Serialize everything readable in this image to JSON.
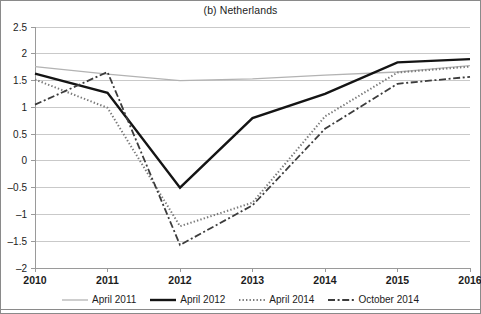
{
  "figure": {
    "title": "(b) Netherlands"
  },
  "chart_data": {
    "type": "line",
    "title": "(b) Netherlands",
    "xlabel": "",
    "ylabel": "",
    "x": [
      2010,
      2011,
      2012,
      2013,
      2014,
      2015,
      2016
    ],
    "xtick_labels": [
      "2010",
      "2011",
      "2012",
      "2013",
      "2014",
      "2015",
      "2016"
    ],
    "ytick_labels": [
      "2.5",
      "2",
      "1.5",
      "1",
      "0.5",
      "0",
      "-0.5",
      "-1",
      "-1.5",
      "-2"
    ],
    "ytick_values": [
      2.5,
      2,
      1.5,
      1,
      0.5,
      0,
      -0.5,
      -1,
      -1.5,
      -2
    ],
    "ylim": [
      -2,
      2.5
    ],
    "xlim": [
      2010,
      2016
    ],
    "grid": "horizontal",
    "legend_position": "bottom",
    "series": [
      {
        "name": "April 2011",
        "style": "solid-thin",
        "color": "#b3b3b3",
        "values": [
          1.76,
          1.62,
          1.5,
          1.53,
          1.6,
          1.66,
          1.78
        ]
      },
      {
        "name": "April 2012",
        "style": "solid-thick",
        "color": "#141414",
        "values": [
          1.63,
          1.27,
          -0.5,
          0.8,
          1.25,
          1.84,
          1.9
        ]
      },
      {
        "name": "April 2014",
        "style": "dotted",
        "color": "#7a7a7a",
        "values": [
          1.52,
          0.99,
          -1.22,
          -0.78,
          0.83,
          1.65,
          1.76
        ]
      },
      {
        "name": "October 2014",
        "style": "dash-dot",
        "color": "#3c3c3c",
        "values": [
          1.05,
          1.66,
          -1.57,
          -0.83,
          0.6,
          1.44,
          1.57
        ]
      }
    ]
  },
  "legend": {
    "items": [
      {
        "label": "April 2011",
        "icon": "line-swatch-solid-thin-icon"
      },
      {
        "label": "April 2012",
        "icon": "line-swatch-solid-thick-icon"
      },
      {
        "label": "April 2014",
        "icon": "line-swatch-dotted-icon"
      },
      {
        "label": "October 2014",
        "icon": "line-swatch-dash-dot-icon"
      }
    ]
  }
}
